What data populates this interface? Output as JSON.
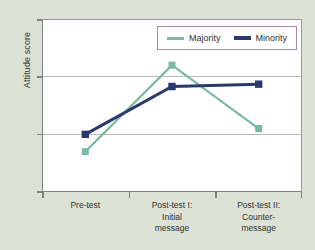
{
  "chart_data": {
    "type": "line",
    "title": "",
    "subtitle": "",
    "xlabel": "",
    "ylabel": "Attitude score",
    "categories": [
      "Pre-test",
      "Post-test I:\nInitial\nmessage",
      "Post-test II:\nCounter-\nmessage"
    ],
    "x_tick_labels": [
      "Pre-test",
      "Post-test I:\nInitial\nmessage",
      "Post-test II:\nCounter-\nmessage"
    ],
    "y_tick_labels": [
      "5",
      "4",
      "3",
      "2"
    ],
    "y_ticks": [
      5,
      4,
      3,
      2
    ],
    "ylim": [
      2,
      5
    ],
    "grid": "horizontal",
    "gridlines_at": [
      4,
      3
    ],
    "legend_position": "top-right",
    "markers": "square",
    "series": [
      {
        "name": "Majority",
        "color": "#7cb9a2",
        "values": [
          2.7,
          4.2,
          3.1
        ]
      },
      {
        "name": "Minority",
        "color": "#2c3a6b",
        "values": [
          3.0,
          3.83,
          3.87
        ]
      }
    ]
  },
  "colors": {
    "background": "#dde2d7",
    "plot_background": "#ffffff",
    "axis": "#7c837d",
    "accent_border": "#a98bb0",
    "gridline": "#b9bcb6",
    "text": "#30322f",
    "majority": "#7cb9a2",
    "minority": "#2c3a6b"
  }
}
